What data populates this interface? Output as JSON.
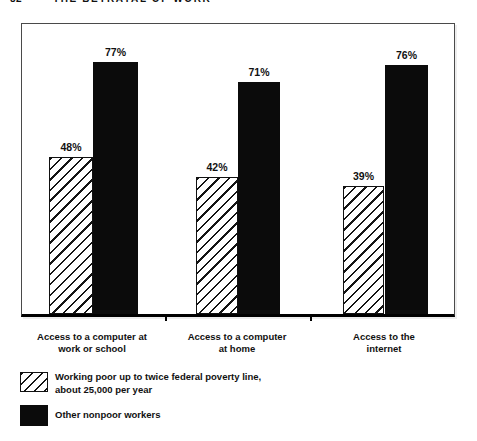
{
  "header": {
    "page_number": "82",
    "running_title": "THE BETRAYAL OF WORK"
  },
  "chart_data": {
    "type": "bar",
    "title": "",
    "xlabel": "",
    "ylabel": "",
    "ylim": [
      0,
      89
    ],
    "grid": false,
    "value_labels_shown": true,
    "legend_position": "bottom-left",
    "categories": [
      {
        "lines": [
          "Access to a computer at",
          "work or school"
        ]
      },
      {
        "lines": [
          "Access to a computer",
          "at home"
        ]
      },
      {
        "lines": [
          "Access to the",
          "internet"
        ]
      }
    ],
    "series": [
      {
        "name": "Working poor up to twice federal poverty line, about 25,000 per year",
        "key": "working-poor",
        "style": "hatched",
        "values": [
          48,
          42,
          39
        ],
        "labels": [
          "48%",
          "42%",
          "39%"
        ]
      },
      {
        "name": "Other nonpoor workers",
        "key": "nonpoor-workers",
        "style": "solid",
        "values": [
          77,
          71,
          76
        ],
        "labels": [
          "77%",
          "71%",
          "76%"
        ]
      }
    ]
  },
  "legend": {
    "items": [
      {
        "swatch": "hatched",
        "lines": [
          "Working poor up to twice federal poverty line,",
          "about 25,000 per year"
        ]
      },
      {
        "swatch": "solid",
        "lines": [
          "Other nonpoor workers"
        ]
      }
    ]
  },
  "colors": {
    "ink": "#111111",
    "paper": "#ffffff",
    "frame_border": "#4a4a4a"
  }
}
